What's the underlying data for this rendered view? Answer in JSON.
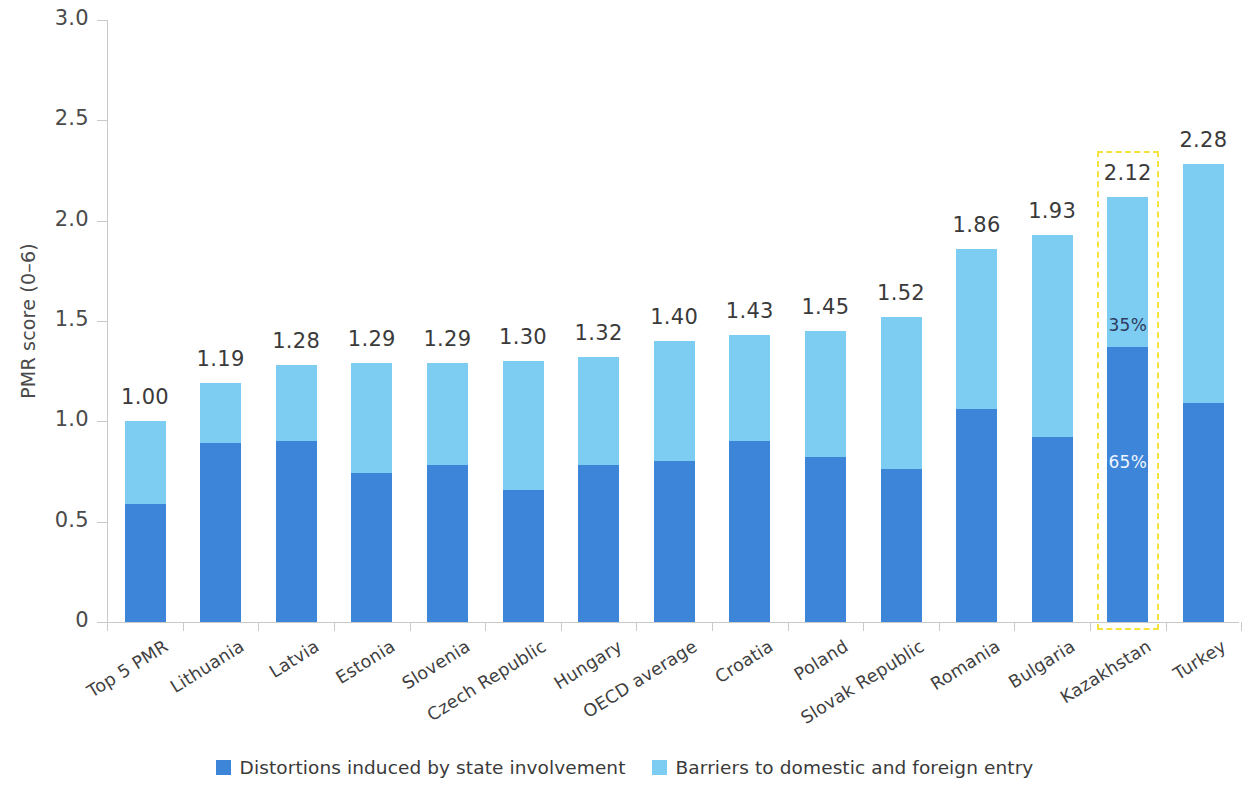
{
  "chart_data": {
    "type": "bar",
    "subtype": "stacked-bar",
    "title": "",
    "xlabel": "",
    "ylabel": "PMR score (0–6)",
    "ylim": [
      0,
      3.0
    ],
    "yticks": [
      "0",
      "0.5",
      "1.0",
      "1.5",
      "2.0",
      "2.5",
      "3.0"
    ],
    "ytick_values": [
      0,
      0.5,
      1.0,
      1.5,
      2.0,
      2.5,
      3.0
    ],
    "grid": false,
    "legend_position": "bottom",
    "categories": [
      "Top 5 PMR",
      "Lithuania",
      "Latvia",
      "Estonia",
      "Slovenia",
      "Czech Republic",
      "Hungary",
      "OECD average",
      "Croatia",
      "Poland",
      "Slovak Republic",
      "Romania",
      "Bulgaria",
      "Kazakhstan",
      "Turkey"
    ],
    "series": [
      {
        "name": "Distortions induced by state involvement",
        "color": "#3d85d8",
        "values": [
          0.59,
          0.89,
          0.9,
          0.74,
          0.78,
          0.66,
          0.78,
          0.8,
          0.9,
          0.82,
          0.76,
          1.06,
          0.92,
          1.37,
          1.09
        ]
      },
      {
        "name": "Barriers to domestic and foreign entry",
        "color": "#7dcdf2",
        "values": [
          0.41,
          0.3,
          0.38,
          0.55,
          0.51,
          0.64,
          0.54,
          0.6,
          0.53,
          0.63,
          0.76,
          0.8,
          1.01,
          0.75,
          1.19
        ]
      }
    ],
    "totals": [
      1.0,
      1.19,
      1.28,
      1.29,
      1.29,
      1.3,
      1.32,
      1.4,
      1.43,
      1.45,
      1.52,
      1.86,
      1.93,
      2.12,
      2.28
    ],
    "total_labels": [
      "1.00",
      "1.19",
      "1.28",
      "1.29",
      "1.29",
      "1.30",
      "1.32",
      "1.40",
      "1.43",
      "1.45",
      "1.52",
      "1.86",
      "1.93",
      "2.12",
      "2.28"
    ],
    "annotations": [
      {
        "category": "Kazakhstan",
        "segment": "Barriers to domestic and foreign entry",
        "text": "35%"
      },
      {
        "category": "Kazakhstan",
        "segment": "Distortions induced by state involvement",
        "text": "65%"
      }
    ],
    "highlight": {
      "category": "Kazakhstan",
      "style": "dashed",
      "color": "#f5e23c"
    }
  },
  "legend": {
    "items": [
      {
        "label": "Distortions induced by state involvement",
        "color": "#3d85d8"
      },
      {
        "label": "Barriers to domestic and foreign entry",
        "color": "#7dcdf2"
      }
    ]
  },
  "axis": {
    "y_title": "PMR score (0–6)"
  }
}
